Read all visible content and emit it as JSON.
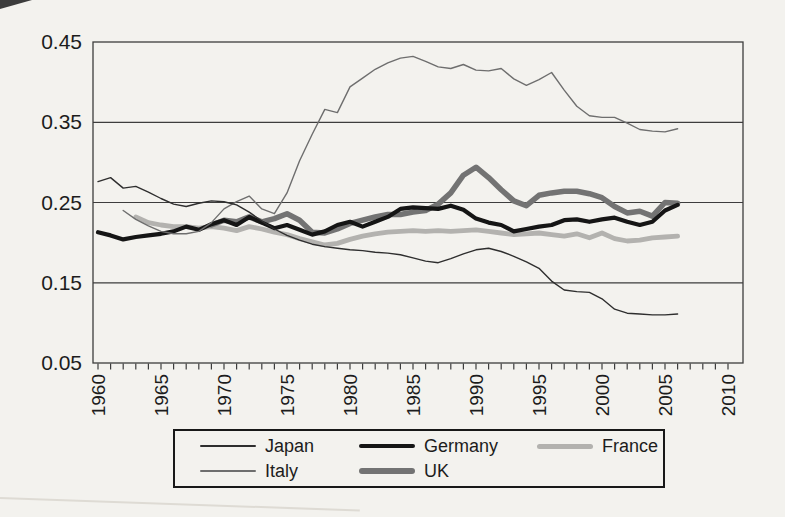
{
  "page": {
    "background": "#f3f2ee",
    "frame_color": "#3d3d3d",
    "text_color": "#1c1c1c"
  },
  "chart_data": {
    "type": "line",
    "title": "",
    "xlabel": "",
    "ylabel": "",
    "x_axis": {
      "min": 1960,
      "max": 2010,
      "label_step": 5,
      "minor_tick_step": 1,
      "tick_labels": [
        "1960",
        "1965",
        "1970",
        "1975",
        "1980",
        "1985",
        "1990",
        "1995",
        "2000",
        "2005",
        "2010"
      ]
    },
    "y_axis": {
      "min": 0.05,
      "max": 0.45,
      "gridlines": [
        0.15,
        0.25,
        0.35
      ],
      "tick_labels": [
        "0.05",
        "0.15",
        "0.25",
        "0.35",
        "0.45"
      ]
    },
    "grid": "horizontal-only",
    "legend_position": "bottom-box",
    "legend_rows": [
      [
        "Japan",
        "Germany",
        "France"
      ],
      [
        "Italy",
        "UK"
      ]
    ],
    "draw_order": [
      "France",
      "UK",
      "Germany",
      "Italy",
      "Japan"
    ],
    "start_year": 1960,
    "series": [
      {
        "name": "Japan",
        "color": "#2e2e2e",
        "width": 1.4,
        "values": [
          0.276,
          0.281,
          0.268,
          0.27,
          0.263,
          0.255,
          0.248,
          0.245,
          0.249,
          0.252,
          0.251,
          0.247,
          0.238,
          0.227,
          0.217,
          0.209,
          0.203,
          0.198,
          0.195,
          0.193,
          0.191,
          0.19,
          0.188,
          0.187,
          0.185,
          0.181,
          0.177,
          0.175,
          0.18,
          0.186,
          0.191,
          0.193,
          0.189,
          0.183,
          0.176,
          0.168,
          0.152,
          0.141,
          0.139,
          0.138,
          0.13,
          0.117,
          0.112,
          0.111,
          0.11,
          0.11,
          0.111
        ]
      },
      {
        "name": "Italy",
        "color": "#6e6e6e",
        "width": 1.4,
        "values": [
          null,
          null,
          0.24,
          0.229,
          0.221,
          0.214,
          0.211,
          0.211,
          0.214,
          0.225,
          0.242,
          0.251,
          0.258,
          0.242,
          0.236,
          0.262,
          0.302,
          0.335,
          0.366,
          0.362,
          0.394,
          0.405,
          0.416,
          0.424,
          0.43,
          0.432,
          0.426,
          0.419,
          0.417,
          0.422,
          0.415,
          0.414,
          0.417,
          0.404,
          0.396,
          0.403,
          0.412,
          0.39,
          0.37,
          0.358,
          0.356,
          0.356,
          0.349,
          0.341,
          0.339,
          0.338,
          0.342
        ]
      },
      {
        "name": "Germany",
        "color": "#151515",
        "width": 4.2,
        "values": [
          0.213,
          0.209,
          0.204,
          0.207,
          0.209,
          0.211,
          0.214,
          0.22,
          0.216,
          0.223,
          0.228,
          0.222,
          0.232,
          0.225,
          0.218,
          0.222,
          0.216,
          0.21,
          0.214,
          0.222,
          0.226,
          0.22,
          0.226,
          0.232,
          0.242,
          0.244,
          0.243,
          0.242,
          0.246,
          0.241,
          0.23,
          0.225,
          0.222,
          0.214,
          0.217,
          0.22,
          0.222,
          0.228,
          0.229,
          0.226,
          0.229,
          0.231,
          0.226,
          0.222,
          0.226,
          0.24,
          0.247
        ]
      },
      {
        "name": "UK",
        "color": "#737373",
        "width": 5.5,
        "values": [
          null,
          null,
          null,
          null,
          null,
          null,
          null,
          null,
          null,
          0.222,
          0.228,
          0.226,
          0.232,
          0.226,
          0.23,
          0.236,
          0.228,
          0.213,
          0.212,
          0.217,
          0.224,
          0.228,
          0.232,
          0.235,
          0.235,
          0.238,
          0.24,
          0.248,
          0.262,
          0.284,
          0.294,
          0.281,
          0.266,
          0.252,
          0.246,
          0.259,
          0.262,
          0.264,
          0.264,
          0.261,
          0.256,
          0.245,
          0.237,
          0.239,
          0.233,
          0.25,
          0.249
        ]
      },
      {
        "name": "France",
        "color": "#b3b2af",
        "width": 4.8,
        "values": [
          null,
          null,
          null,
          0.232,
          0.225,
          0.222,
          0.22,
          0.22,
          0.218,
          0.22,
          0.218,
          0.215,
          0.22,
          0.217,
          0.213,
          0.21,
          0.205,
          0.201,
          0.197,
          0.199,
          0.204,
          0.208,
          0.211,
          0.213,
          0.214,
          0.215,
          0.214,
          0.215,
          0.214,
          0.215,
          0.216,
          0.214,
          0.212,
          0.21,
          0.211,
          0.212,
          0.21,
          0.208,
          0.211,
          0.206,
          0.212,
          0.205,
          0.202,
          0.203,
          0.206,
          0.207,
          0.208
        ]
      }
    ]
  }
}
